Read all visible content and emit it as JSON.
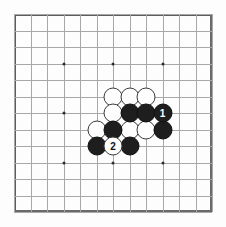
{
  "figure": {
    "name": "go-board-diagram",
    "board_size": 13,
    "grid": {
      "origin_x": 14,
      "origin_y": 14,
      "spacing": 16.5,
      "line_color": "#a8a8a8",
      "frame_color": "#5d5d5d",
      "background": "#fdfdfd"
    },
    "star_points": [
      {
        "col": 3,
        "row": 3
      },
      {
        "col": 6,
        "row": 3
      },
      {
        "col": 9,
        "row": 3
      },
      {
        "col": 3,
        "row": 6
      },
      {
        "col": 9,
        "row": 6
      },
      {
        "col": 3,
        "row": 9
      },
      {
        "col": 6,
        "row": 9
      },
      {
        "col": 9,
        "row": 9
      }
    ],
    "colors": {
      "black_stone": "#1e1e1e",
      "white_stone": "#fefefe",
      "black_label": "#ffffff",
      "white_label": "#111111"
    },
    "stones": [
      {
        "col": 6,
        "row": 5,
        "color": "white",
        "label": ""
      },
      {
        "col": 7,
        "row": 5,
        "color": "white",
        "label": ""
      },
      {
        "col": 8,
        "row": 5,
        "color": "white",
        "label": ""
      },
      {
        "col": 6,
        "row": 6,
        "color": "white",
        "label": ""
      },
      {
        "col": 7,
        "row": 6,
        "color": "black",
        "label": ""
      },
      {
        "col": 8,
        "row": 6,
        "color": "black",
        "label": ""
      },
      {
        "col": 9,
        "row": 6,
        "color": "black",
        "label": "1"
      },
      {
        "col": 5,
        "row": 7,
        "color": "white",
        "label": ""
      },
      {
        "col": 6,
        "row": 7,
        "color": "black",
        "label": ""
      },
      {
        "col": 7,
        "row": 7,
        "color": "white",
        "label": ""
      },
      {
        "col": 8,
        "row": 7,
        "color": "white",
        "label": ""
      },
      {
        "col": 9,
        "row": 7,
        "color": "black",
        "label": ""
      },
      {
        "col": 5,
        "row": 8,
        "color": "black",
        "label": ""
      },
      {
        "col": 6,
        "row": 8,
        "color": "white",
        "label": "2"
      },
      {
        "col": 7,
        "row": 8,
        "color": "black",
        "label": ""
      }
    ],
    "move_labels": [
      "1",
      "2"
    ]
  }
}
